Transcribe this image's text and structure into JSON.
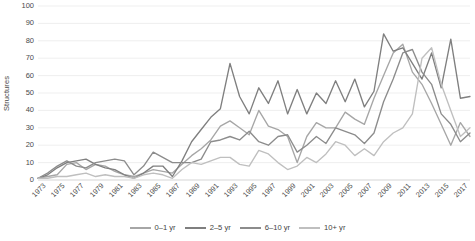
{
  "chart_data": {
    "type": "line",
    "title": "",
    "xlabel": "",
    "ylabel": "Structures",
    "ylim": [
      0,
      100
    ],
    "ytick_step": 10,
    "yticks": [
      100,
      90,
      80,
      70,
      60,
      50,
      40,
      30,
      20,
      10,
      0
    ],
    "grid": "horizontal",
    "legend_position": "bottom",
    "x": [
      1973,
      1974,
      1975,
      1976,
      1977,
      1978,
      1979,
      1980,
      1981,
      1982,
      1983,
      1984,
      1985,
      1986,
      1987,
      1988,
      1989,
      1990,
      1991,
      1992,
      1993,
      1994,
      1995,
      1996,
      1997,
      1998,
      1999,
      2000,
      2001,
      2002,
      2003,
      2004,
      2005,
      2006,
      2007,
      2008,
      2009,
      2010,
      2011,
      2012,
      2013,
      2014,
      2015,
      2016,
      2017,
      2018
    ],
    "xtick_labels": [
      "1973",
      "1975",
      "1977",
      "1979",
      "1981",
      "1983",
      "1985",
      "1987",
      "1989",
      "1991",
      "1993",
      "1995",
      "1997",
      "1999",
      "2001",
      "2003",
      "2005",
      "2007",
      "2009",
      "2011",
      "2013",
      "2015",
      "2017"
    ],
    "series": [
      {
        "name": "0–1 yr",
        "color": "#a6a6a6",
        "values": [
          1,
          2,
          3,
          9,
          10,
          6,
          9,
          8,
          5,
          3,
          2,
          4,
          6,
          5,
          4,
          9,
          14,
          18,
          23,
          31,
          34,
          30,
          26,
          40,
          31,
          29,
          25,
          10,
          25,
          33,
          30,
          30,
          39,
          35,
          32,
          47,
          60,
          73,
          78,
          62,
          55,
          44,
          32,
          20,
          33,
          25
        ]
      },
      {
        "name": "2–5 yr",
        "color": "#7f7f7f",
        "values": [
          1,
          3,
          7,
          10,
          11,
          12,
          9,
          7,
          6,
          3,
          1,
          4,
          8,
          8,
          2,
          11,
          22,
          29,
          36,
          41,
          67,
          48,
          38,
          53,
          44,
          57,
          38,
          52,
          38,
          50,
          44,
          57,
          45,
          58,
          42,
          51,
          84,
          74,
          76,
          67,
          58,
          73,
          53,
          81,
          47,
          48
        ]
      },
      {
        "name": "6–10 yr",
        "color": "#8c8c8c",
        "values": [
          1,
          4,
          8,
          11,
          8,
          7,
          10,
          11,
          12,
          11,
          3,
          8,
          16,
          13,
          10,
          10,
          10,
          12,
          22,
          23,
          25,
          23,
          28,
          22,
          20,
          25,
          26,
          16,
          20,
          25,
          21,
          30,
          28,
          26,
          21,
          27,
          45,
          58,
          73,
          75,
          62,
          55,
          38,
          32,
          22,
          27
        ]
      },
      {
        "name": "10+ yr",
        "color": "#bfbfbf",
        "values": [
          1,
          1,
          2,
          2,
          3,
          4,
          2,
          3,
          2,
          2,
          1,
          3,
          4,
          3,
          1,
          6,
          10,
          9,
          11,
          13,
          13,
          9,
          8,
          17,
          15,
          10,
          6,
          8,
          13,
          10,
          15,
          22,
          20,
          14,
          18,
          14,
          22,
          27,
          30,
          38,
          70,
          76,
          55,
          40,
          25,
          30
        ]
      }
    ]
  },
  "legend": {
    "items": [
      {
        "label": "0–1 yr"
      },
      {
        "label": "2–5 yr"
      },
      {
        "label": "6–10 yr"
      },
      {
        "label": "10+ yr"
      }
    ]
  },
  "axes": {
    "y_title": "Structures",
    "gridline_color": "#e8e8e8",
    "axis_color": "#d0d0d0"
  }
}
